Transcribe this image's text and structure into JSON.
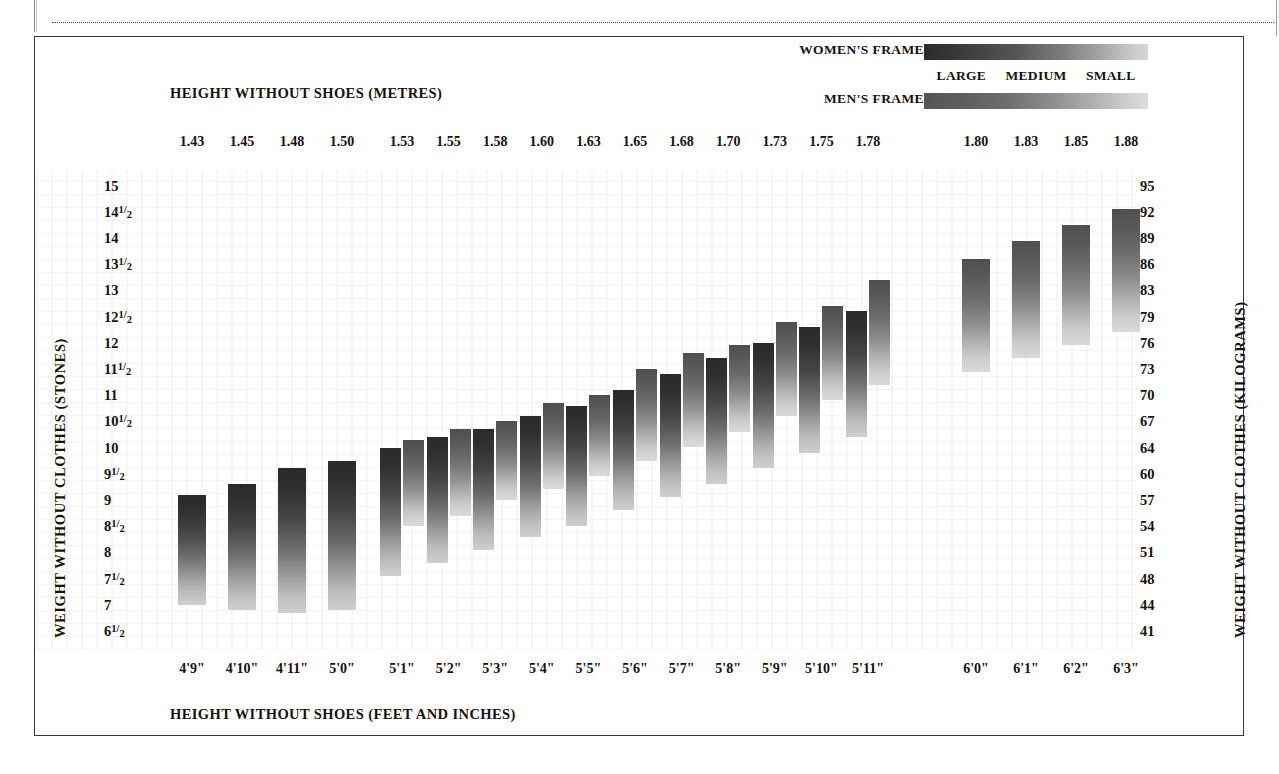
{
  "legend": {
    "women_label": "WOMEN'S FRAME",
    "men_label": "MEN'S FRAME",
    "scale": [
      "LARGE",
      "MEDIUM",
      "SMALL"
    ],
    "women_gradient_dark": "#2b2b2b",
    "women_gradient_light": "#d6d6d6",
    "men_gradient_dark": "#555555",
    "men_gradient_light": "#dcdcdc"
  },
  "titles": {
    "top": "HEIGHT WITHOUT SHOES (METRES)",
    "bottom": "HEIGHT WITHOUT SHOES (FEET AND INCHES)",
    "left": "WEIGHT WITHOUT CLOTHES (STONES)",
    "right": "WEIGHT WITHOUT CLOTHES (KILOGRAMS)"
  },
  "chart_data": {
    "type": "bar",
    "xlabel": "HEIGHT WITHOUT SHOES (FEET AND INCHES)",
    "ylabel": "WEIGHT WITHOUT CLOTHES (STONES)",
    "ylabel_right": "WEIGHT WITHOUT CLOTHES (KILOGRAMS)",
    "xlabel_top": "HEIGHT WITHOUT SHOES (METRES)",
    "grid": false,
    "legend_position": "top-right",
    "categories_metres": [
      "1.43",
      "1.45",
      "1.48",
      "1.50",
      "1.53",
      "1.55",
      "1.58",
      "1.60",
      "1.63",
      "1.65",
      "1.68",
      "1.70",
      "1.73",
      "1.75",
      "1.78",
      "1.80",
      "1.83",
      "1.85",
      "1.88"
    ],
    "categories_feet": [
      "4'9\"",
      "4'10\"",
      "4'11\"",
      "5'0\"",
      "5'1\"",
      "5'2\"",
      "5'3\"",
      "5'4\"",
      "5'5\"",
      "5'6\"",
      "5'7\"",
      "5'8\"",
      "5'9\"",
      "5'10\"",
      "5'11\"",
      "6'0\"",
      "6'1\"",
      "6'2\"",
      "6'3\""
    ],
    "yticks_stones": [
      "15",
      "14½",
      "14",
      "13½",
      "13",
      "12½",
      "12",
      "11½",
      "11",
      "10½",
      "10",
      "9½",
      "9",
      "8½",
      "8",
      "7½",
      "7",
      "6½"
    ],
    "yticks_stones_values": [
      15,
      14.5,
      14,
      13.5,
      13,
      12.5,
      12,
      11.5,
      11,
      10.5,
      10,
      9.5,
      9,
      8.5,
      8,
      7.5,
      7,
      6.5
    ],
    "yticks_kilograms": [
      "95",
      "92",
      "89",
      "86",
      "83",
      "79",
      "76",
      "73",
      "70",
      "67",
      "64",
      "60",
      "57",
      "54",
      "51",
      "48",
      "44",
      "41"
    ],
    "ylim_stones": [
      6.5,
      15.0
    ],
    "series": [
      {
        "name": "WOMEN'S FRAME",
        "kind": "range-bar",
        "color_dark": "#2a2a2a",
        "color_light": "#cfcfcf",
        "ranges_stones": [
          [
            7.0,
            9.1
          ],
          [
            6.9,
            9.3
          ],
          [
            6.85,
            9.6
          ],
          [
            6.9,
            9.75
          ],
          [
            7.55,
            10.0
          ],
          [
            7.8,
            10.2
          ],
          [
            8.05,
            10.35
          ],
          [
            8.3,
            10.6
          ],
          [
            8.5,
            10.8
          ],
          [
            8.8,
            11.1
          ],
          [
            9.05,
            11.4
          ],
          [
            9.3,
            11.7
          ],
          [
            9.6,
            12.0
          ],
          [
            9.9,
            12.3
          ],
          [
            10.2,
            12.6
          ],
          null,
          null,
          null,
          null
        ]
      },
      {
        "name": "MEN'S FRAME",
        "kind": "range-bar",
        "color_dark": "#4f4f4f",
        "color_light": "#dadada",
        "ranges_stones": [
          null,
          null,
          null,
          null,
          [
            8.5,
            10.15
          ],
          [
            8.7,
            10.35
          ],
          [
            9.0,
            10.5
          ],
          [
            9.2,
            10.85
          ],
          [
            9.45,
            11.0
          ],
          [
            9.75,
            11.5
          ],
          [
            10.0,
            11.8
          ],
          [
            10.3,
            11.95
          ],
          [
            10.6,
            12.4
          ],
          [
            10.9,
            12.7
          ],
          [
            11.2,
            13.2
          ],
          [
            11.45,
            13.6
          ],
          [
            11.7,
            13.95
          ],
          [
            11.95,
            14.25
          ],
          [
            12.2,
            14.55
          ]
        ]
      }
    ]
  }
}
